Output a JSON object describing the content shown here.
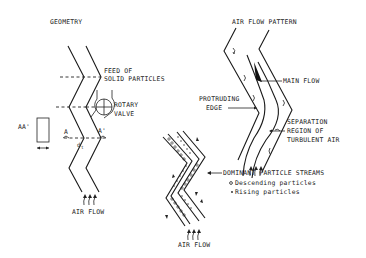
{
  "panels": {
    "geometry": {
      "title": "GEOMETRY",
      "labels": {
        "feed": [
          "FEED OF",
          "SOLID PARTICLES"
        ],
        "valve": [
          "ROTARY",
          "VALVE"
        ],
        "section": "AA'",
        "cut_a": "A",
        "cut_a_prime": "A'",
        "dt": "d",
        "dt_sub": "t",
        "airflow": "AIR FLOW"
      }
    },
    "air_flow_pattern": {
      "title": "AIR FLOW PATTERN",
      "labels": {
        "main_flow": "MAIN FLOW",
        "protruding_edge": [
          "PROTRUDING",
          "EDGE"
        ],
        "separation": [
          "SEPARATION",
          "REGION OF",
          "TURBULENT AIR"
        ]
      }
    },
    "particle_streams": {
      "title": "DOMINANT PARTICLE STREAMS",
      "legend": [
        {
          "symbol": "o",
          "label": "Descending particles"
        },
        {
          "symbol": "•",
          "label": "Rising particles"
        }
      ],
      "airflow": "AIR FLOW"
    }
  }
}
